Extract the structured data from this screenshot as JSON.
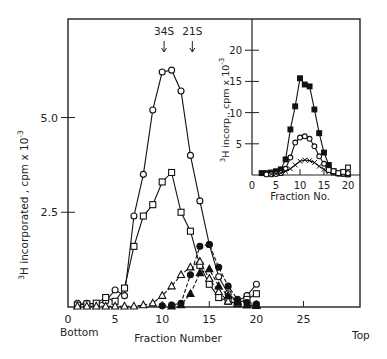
{
  "chart_data": [
    {
      "id": "main",
      "type": "line",
      "title": "",
      "xlabel": "Fraction Number",
      "ylabel": "3H incorporated , cpm x 10-3",
      "ylabel_parts": {
        "sup": "3",
        "base": "H incorporated , cpm x 10",
        "exp": "-3"
      },
      "xlim": [
        0,
        31
      ],
      "ylim": [
        0,
        7.6
      ],
      "xticks": [
        0,
        5,
        10,
        15,
        20,
        25
      ],
      "xtick_labels": [
        "0",
        "5",
        "10",
        "15",
        "20",
        "25"
      ],
      "yticks": [
        2.5,
        5.0
      ],
      "ytick_labels": [
        "2.5",
        "5.0"
      ],
      "x_end_labels": {
        "left": "Bottom",
        "right": "Top"
      },
      "annotations": [
        {
          "label": "34S",
          "x": 10.2
        },
        {
          "label": "21S",
          "x": 13.2
        }
      ],
      "grid": false,
      "series": [
        {
          "name": "open-circle",
          "marker": "open-circle",
          "x": [
            1,
            2,
            3,
            4,
            5,
            6,
            7,
            8,
            9,
            10,
            11,
            12,
            13,
            14,
            15,
            16,
            17,
            18,
            19,
            20
          ],
          "y": [
            0.1,
            0.1,
            0.08,
            0.15,
            0.45,
            0.3,
            2.4,
            3.5,
            5.2,
            6.2,
            6.25,
            5.7,
            4.0,
            2.8,
            1.65,
            0.8,
            0.35,
            0.15,
            0.3,
            0.6
          ]
        },
        {
          "name": "open-square",
          "marker": "open-square",
          "x": [
            1,
            2,
            3,
            4,
            5,
            6,
            7,
            8,
            9,
            10,
            11,
            12,
            13,
            14,
            15,
            16,
            17,
            18,
            19,
            20
          ],
          "y": [
            0.05,
            0.08,
            0.1,
            0.25,
            0.15,
            0.5,
            1.6,
            2.4,
            2.7,
            3.3,
            3.55,
            2.5,
            2.0,
            1.1,
            0.6,
            0.25,
            0.15,
            0.1,
            0.2,
            0.35
          ]
        },
        {
          "name": "open-triangle",
          "marker": "open-triangle",
          "x": [
            1,
            2,
            3,
            4,
            5,
            6,
            7,
            8,
            9,
            10,
            11,
            12,
            13,
            14,
            15,
            16,
            17,
            18,
            19,
            20
          ],
          "y": [
            0.02,
            0.02,
            0.02,
            0.02,
            0.02,
            0.02,
            0.02,
            0.05,
            0.1,
            0.3,
            0.55,
            0.85,
            1.05,
            1.2,
            0.75,
            0.4,
            0.15,
            0.08,
            0.05,
            0.05
          ]
        },
        {
          "name": "filled-circle",
          "marker": "filled-circle",
          "x": [
            10,
            11,
            12,
            13,
            14,
            15,
            16,
            17,
            18,
            19,
            20
          ],
          "y": [
            0.03,
            0.05,
            0.1,
            0.85,
            1.6,
            1.65,
            1.05,
            0.55,
            0.2,
            0.12,
            0.08
          ]
        },
        {
          "name": "filled-triangle",
          "marker": "filled-triangle",
          "x": [
            11,
            12,
            13,
            14,
            15,
            16,
            17,
            18,
            19,
            20
          ],
          "y": [
            0.02,
            0.05,
            0.35,
            0.9,
            1.0,
            0.55,
            0.3,
            0.12,
            0.05,
            0.03
          ]
        }
      ]
    },
    {
      "id": "inset",
      "type": "line",
      "title": "",
      "xlabel": "Fraction No.",
      "ylabel": "3H incorp., cpm x 10-3",
      "ylabel_parts": {
        "sup": "3",
        "base": "H incorp., cpm x 10",
        "exp": "-3"
      },
      "xlim": [
        0,
        22.5
      ],
      "ylim": [
        0,
        25
      ],
      "xticks": [
        0,
        5,
        10,
        15,
        20
      ],
      "xtick_labels": [
        "0",
        "5",
        "10",
        "15",
        "20"
      ],
      "yticks": [
        5,
        10,
        15,
        20
      ],
      "ytick_labels": [
        "5",
        "10",
        "15",
        "20"
      ],
      "grid": false,
      "series": [
        {
          "name": "filled-square",
          "marker": "filled-square",
          "x": [
            2,
            3,
            4,
            5,
            6,
            7,
            8,
            9,
            10,
            11,
            12,
            13,
            14,
            15,
            16,
            17,
            18,
            19,
            20
          ],
          "y": [
            0.3,
            0.3,
            0.4,
            0.6,
            0.9,
            2.5,
            7.3,
            11.0,
            15.5,
            14.5,
            14.2,
            10.5,
            6.7,
            3.6,
            1.6,
            0.6,
            0.3,
            0.2,
            0.1
          ]
        },
        {
          "name": "open-circle",
          "marker": "open-circle",
          "x": [
            3,
            4,
            5,
            6,
            7,
            8,
            9,
            10,
            11,
            12,
            13,
            14,
            15,
            16,
            17,
            18,
            19,
            20
          ],
          "y": [
            0.1,
            0.1,
            0.15,
            0.3,
            1.0,
            2.8,
            5.2,
            6.0,
            6.2,
            5.8,
            4.6,
            3.0,
            1.8,
            0.8,
            0.4,
            0.2,
            0.2,
            0.3
          ]
        },
        {
          "name": "cross",
          "marker": "cross",
          "x": [
            4,
            5,
            6,
            7,
            8,
            9,
            10,
            11,
            12,
            13,
            14,
            15,
            16,
            17,
            18
          ],
          "y": [
            0.1,
            0.2,
            0.3,
            0.6,
            1.0,
            1.6,
            2.2,
            2.4,
            2.3,
            2.0,
            1.4,
            0.9,
            0.5,
            0.3,
            0.2
          ]
        },
        {
          "name": "open-square",
          "marker": "open-square",
          "x": [
            16,
            17,
            18,
            19,
            20
          ],
          "y": [
            0.8,
            0.6,
            0.3,
            0.5,
            1.2
          ]
        }
      ]
    }
  ]
}
